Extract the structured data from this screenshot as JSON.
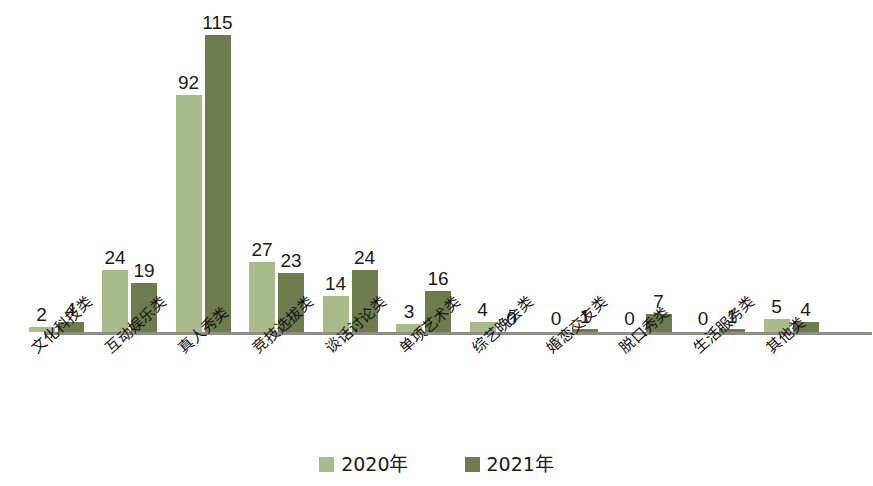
{
  "chart_data": {
    "type": "bar",
    "title": "",
    "xlabel": "",
    "ylabel": "",
    "grid": false,
    "legend_position": "bottom-center",
    "ylim": [
      0,
      115
    ],
    "axis_visible": "x-only",
    "categories": [
      "文化科技类",
      "互动娱乐类",
      "真人秀类",
      "竞技选拔类",
      "谈话讨论类",
      "单项艺术类",
      "综艺晚会类",
      "婚恋交友类",
      "脱口秀类",
      "生活服务类",
      "其他类"
    ],
    "series": [
      {
        "name": "2020年",
        "color": "#a9ba8b",
        "values": [
          2,
          24,
          92,
          27,
          14,
          3,
          4,
          0,
          0,
          0,
          5
        ]
      },
      {
        "name": "2021年",
        "color": "#6d7b4d",
        "values": [
          4,
          19,
          115,
          23,
          24,
          16,
          0,
          1,
          7,
          1,
          4
        ]
      }
    ]
  },
  "legend": {
    "items": [
      {
        "label": "2020年",
        "color": "#a9ba8b"
      },
      {
        "label": "2021年",
        "color": "#6d7b4d"
      }
    ]
  },
  "colors": {
    "series_2020": "#a9ba8b",
    "series_2021": "#6d7b4d",
    "axis": "#8d8f86",
    "text": "#1a1a1a",
    "background": "#ffffff"
  }
}
